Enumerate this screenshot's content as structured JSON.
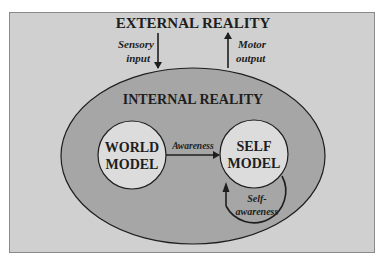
{
  "diagram": {
    "external_title": "EXTERNAL REALITY",
    "internal_title": "INTERNAL REALITY",
    "sensory": {
      "line1": "Sensory",
      "line2": "input"
    },
    "motor": {
      "line1": "Motor",
      "line2": "output"
    },
    "world_model": {
      "line1": "WORLD",
      "line2": "MODEL"
    },
    "self_model": {
      "line1": "SELF",
      "line2": "MODEL"
    },
    "awareness": "Awareness",
    "self_awareness": {
      "line1": "Self-",
      "line2": "awareness"
    }
  },
  "colors": {
    "outer_box": "#d0d0d0",
    "ellipse": "#a6a6a6",
    "circle": "#dcdcdc",
    "stroke": "#1e1e1e"
  }
}
